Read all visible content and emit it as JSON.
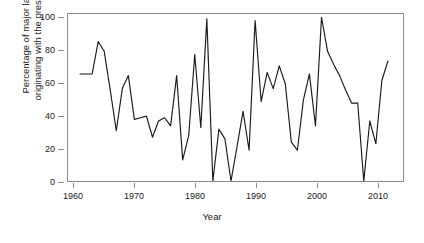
{
  "chart_data": {
    "type": "line",
    "title": "",
    "xlabel": "Year",
    "ylabel": "Percentage of major laws originating with the president",
    "ylabel_lines": [
      "Percentage of major laws",
      "originating with the president"
    ],
    "xlim": [
      1959.0,
      2014.5
    ],
    "ylim": [
      0,
      103
    ],
    "grid": false,
    "legend": false,
    "legend_position": "none",
    "line_color": "#1a1a1a",
    "frame_color": "#8a8a8a",
    "background_color": "#ffffff",
    "xticks": [
      1960,
      1970,
      1980,
      1990,
      2000,
      2010
    ],
    "xtick_labels": [
      "1960",
      "1970",
      "1980",
      "1990",
      "2000",
      "2010"
    ],
    "yticks": [
      0,
      20,
      40,
      60,
      80,
      100
    ],
    "ytick_labels": [
      "0",
      "20",
      "40",
      "60",
      "80",
      "100"
    ],
    "x": [
      1961,
      1962,
      1963,
      1964,
      1965,
      1966,
      1967,
      1968,
      1969,
      1970,
      1971,
      1972,
      1973,
      1974,
      1975,
      1976,
      1977,
      1978,
      1979,
      1980,
      1981,
      1982,
      1983,
      1984,
      1985,
      1986,
      1987,
      1988,
      1989,
      1990,
      1991,
      1992,
      1993,
      1994,
      1995,
      1996,
      1997,
      1998,
      1999,
      2000,
      2001,
      2002,
      2003,
      2004,
      2005,
      2006,
      2007,
      2008,
      2009,
      2010,
      2011,
      2012
    ],
    "values": [
      66,
      66,
      66,
      86,
      80,
      56,
      31,
      57,
      65,
      38,
      39,
      40,
      27,
      37,
      39,
      34,
      65,
      13,
      28,
      78,
      33,
      100,
      0,
      32,
      26,
      0,
      21,
      43,
      19,
      99,
      49,
      67,
      57,
      71,
      60,
      24,
      19,
      50,
      66,
      34,
      101,
      80,
      72,
      65,
      56,
      48,
      48,
      0,
      37,
      23,
      62,
      74
    ],
    "series": [
      {
        "name": "Percentage of major laws originating with the president",
        "values": [
          66,
          66,
          66,
          86,
          80,
          56,
          31,
          57,
          65,
          38,
          39,
          40,
          27,
          37,
          39,
          34,
          65,
          13,
          28,
          78,
          33,
          100,
          0,
          32,
          26,
          0,
          21,
          43,
          19,
          99,
          49,
          67,
          57,
          71,
          60,
          24,
          19,
          50,
          66,
          34,
          101,
          80,
          72,
          65,
          56,
          48,
          48,
          0,
          37,
          23,
          62,
          74
        ]
      }
    ]
  }
}
